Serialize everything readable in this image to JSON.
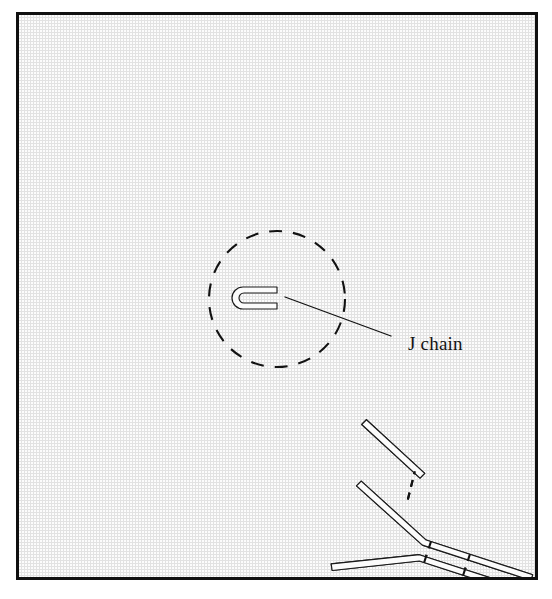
{
  "figure": {
    "domain_kind": "scientific-diagram",
    "background_color": "#e2e2e2",
    "frame_color": "#101010",
    "ink_color": "#121212",
    "rod_fill_color": "#fbfbfb",
    "labels": [
      {
        "id": "j-chain",
        "text": "J chain",
        "x": 389,
        "y": 319,
        "font_size": 19
      }
    ],
    "caption_sliver": "",
    "core": {
      "name": "central-disulfide-ring",
      "center_x": 276,
      "center_y": 296,
      "radius": 68,
      "dash_pattern": "13 11",
      "gaps_note": "dashed circle interrupted where heavy-chain tails enter"
    },
    "j_chain_glyph": {
      "name": "j-chain-hairpin",
      "center_x": 276,
      "center_y": 291,
      "width": 44,
      "height": 22,
      "opening": "right"
    },
    "leader": {
      "name": "j-chain-leader-line",
      "x1": 284,
      "y1": 293,
      "x2": 388,
      "y2": 331
    },
    "monomer_count": 5,
    "monomer_angles_deg": [
      -90,
      -18,
      54,
      126,
      198
    ],
    "monomer_note": "five Y-shaped IgM monomers radiating from a central J chain; each monomer has two heavy chains and two light chains joined by dashed disulfide bonds",
    "legend_terms": [
      "heavy chain",
      "light chain",
      "disulfide bond",
      "J chain"
    ]
  }
}
